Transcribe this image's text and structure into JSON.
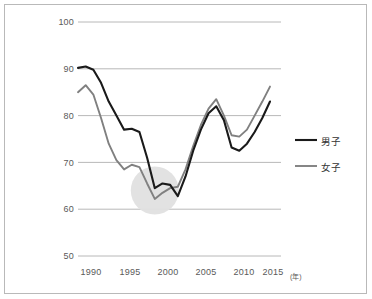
{
  "figure": {
    "border_color": "#b9b9b9",
    "background": "#ffffff"
  },
  "legend": {
    "position": "right",
    "entries": [
      {
        "label": "男子",
        "color": "#1a1a1a",
        "name": "series-male"
      },
      {
        "label": "女子",
        "color": "#808080",
        "name": "series-female"
      }
    ]
  },
  "axes": {
    "x_unit_label": "(年)",
    "y_ticks": [
      "100",
      "90",
      "80",
      "70",
      "60",
      "50"
    ],
    "x_ticks": [
      "1990",
      "1995",
      "2000",
      "2005",
      "2010",
      "2015"
    ]
  },
  "highlight": {
    "name": "valley-highlight-circle",
    "color": "#e0e0e0",
    "center_year": 2000,
    "center_value": 64
  },
  "chart_data": {
    "type": "line",
    "title": "",
    "subtitle": "",
    "xlabel": "(年)",
    "ylabel": "",
    "xlim": [
      1990,
      2015
    ],
    "ylim": [
      50,
      100
    ],
    "y_ticks": [
      50,
      60,
      70,
      80,
      90,
      100
    ],
    "x_ticks": [
      1990,
      1995,
      2000,
      2005,
      2010,
      2015
    ],
    "grid": "horizontal",
    "legend_position": "right",
    "x": [
      1990,
      1991,
      1992,
      1993,
      1994,
      1995,
      1996,
      1997,
      1998,
      1999,
      2000,
      2001,
      2002,
      2003,
      2004,
      2005,
      2006,
      2007,
      2008,
      2009,
      2010,
      2011,
      2012,
      2013,
      2014,
      2015
    ],
    "series": [
      {
        "name": "男子",
        "color": "#1a1a1a",
        "values": [
          90.2,
          90.5,
          89.8,
          87.0,
          83.0,
          80.0,
          77.0,
          77.2,
          76.5,
          71.0,
          64.5,
          65.5,
          65.2,
          62.8,
          67.0,
          72.5,
          77.0,
          80.5,
          82.0,
          79.0,
          73.2,
          72.5,
          74.0,
          76.5,
          79.5,
          83.0
        ]
      },
      {
        "name": "女子",
        "color": "#808080",
        "values": [
          85.0,
          86.5,
          84.5,
          79.5,
          74.0,
          70.5,
          68.5,
          69.5,
          69.0,
          65.5,
          62.2,
          63.5,
          64.5,
          64.8,
          68.5,
          73.5,
          78.0,
          81.5,
          83.5,
          80.0,
          75.8,
          75.5,
          77.0,
          80.0,
          83.0,
          86.2
        ]
      }
    ]
  }
}
